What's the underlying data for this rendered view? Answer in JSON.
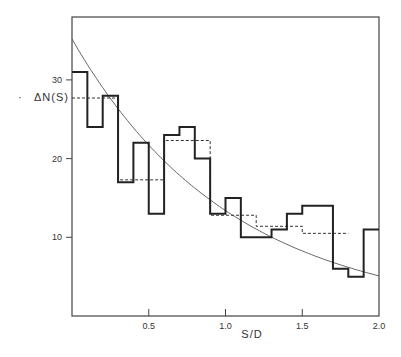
{
  "chart_data": {
    "type": "bar",
    "subtype": "step-histogram with fitted curve",
    "title": "",
    "xlabel": "S/D",
    "ylabel": "ΔN(S)",
    "xlim": [
      0,
      2.0
    ],
    "ylim": [
      0,
      37
    ],
    "grid": false,
    "legend": null,
    "x_ticks": [
      {
        "value": 0.5,
        "label": "0.5"
      },
      {
        "value": 1.0,
        "label": "1.0"
      },
      {
        "value": 1.5,
        "label": "1.5"
      },
      {
        "value": 2.0,
        "label": "2.0"
      }
    ],
    "y_ticks": [
      {
        "value": 10,
        "label": "10"
      },
      {
        "value": 20,
        "label": "20"
      },
      {
        "value": 30,
        "label": "30"
      }
    ],
    "series": [
      {
        "name": "histogram (bin width 0.1)",
        "style": "solid-thick-step",
        "bin_edges": [
          0,
          0.1,
          0.2,
          0.3,
          0.4,
          0.5,
          0.6,
          0.7,
          0.8,
          0.9,
          1.0,
          1.1,
          1.2,
          1.3,
          1.4,
          1.5,
          1.6,
          1.7,
          1.8,
          1.9,
          2.0
        ],
        "values": [
          31,
          24,
          28,
          17,
          22,
          13,
          23,
          24,
          20,
          13,
          15,
          10,
          10,
          11,
          13,
          14,
          14,
          6,
          5,
          11
        ]
      },
      {
        "name": "histogram (bin width 0.3)",
        "style": "dashed-step",
        "bin_edges": [
          0,
          0.3,
          0.6,
          0.9,
          1.2,
          1.5,
          1.8
        ],
        "values": [
          27.7,
          17.3,
          22.3,
          12.8,
          11.4,
          10.5
        ]
      },
      {
        "name": "fitted exponential curve",
        "style": "thin-line",
        "function": "35.2 * exp(-0.966 * x)",
        "x": [
          0,
          0.25,
          0.5,
          0.75,
          1.0,
          1.25,
          1.5,
          1.75,
          2.0
        ],
        "values": [
          35.2,
          27.6,
          21.7,
          17.0,
          13.4,
          10.5,
          8.3,
          6.5,
          5.1
        ]
      }
    ]
  },
  "labels": {
    "ylabel": "ΔN(S)",
    "xlabel": "S/D",
    "ylabel_dot": "·"
  }
}
